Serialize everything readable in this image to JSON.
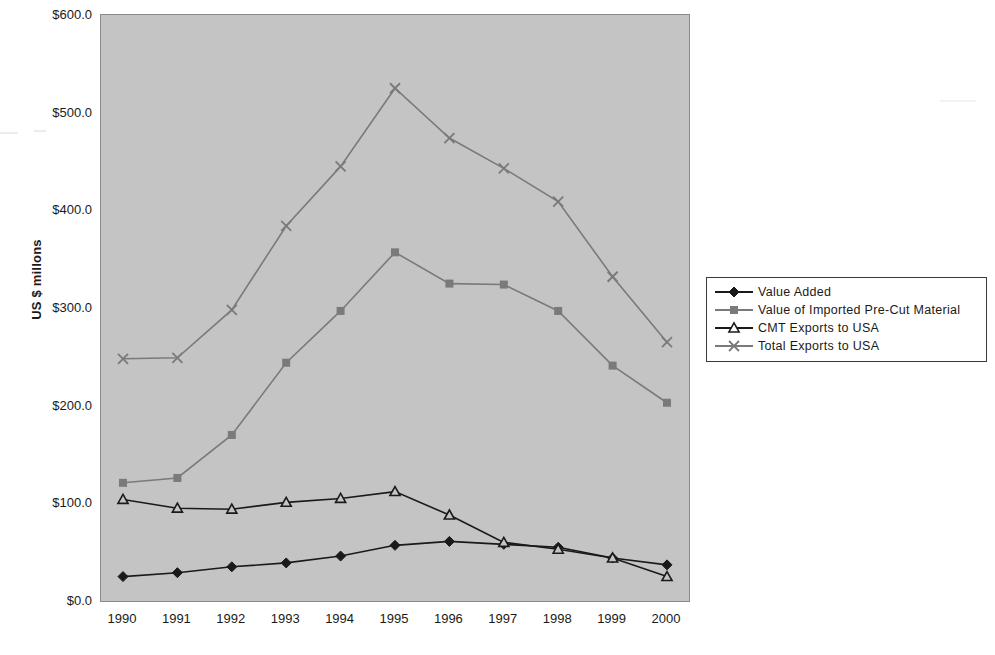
{
  "chart_data": {
    "type": "line",
    "title": "",
    "xlabel": "",
    "ylabel": "US $ millons",
    "categories": [
      "1990",
      "1991",
      "1992",
      "1993",
      "1994",
      "1995",
      "1996",
      "1997",
      "1998",
      "1999",
      "2000"
    ],
    "ylim": [
      0,
      600
    ],
    "y_ticks": [
      "$0.0",
      "$100.0",
      "$200.0",
      "$300.0",
      "$400.0",
      "$500.0",
      "$600.0"
    ],
    "y_tick_values": [
      0,
      100,
      200,
      300,
      400,
      500,
      600
    ],
    "grid": false,
    "legend_position": "right",
    "series": [
      {
        "name": "Value Added",
        "marker": "diamond",
        "color": "#1a1a1a",
        "values": [
          25,
          29,
          35,
          39,
          46,
          57,
          61,
          58,
          55,
          44,
          37
        ]
      },
      {
        "name": "Value of Imported Pre-Cut Material",
        "marker": "square",
        "color": "#7a7a7a",
        "values": [
          121,
          126,
          170,
          244,
          297,
          357,
          325,
          324,
          297,
          241,
          203
        ]
      },
      {
        "name": "CMT Exports to USA",
        "marker": "triangle",
        "color": "#1a1a1a",
        "values": [
          104,
          95,
          94,
          101,
          105,
          112,
          88,
          60,
          53,
          44,
          25
        ]
      },
      {
        "name": "Total Exports to USA",
        "marker": "cross",
        "color": "#7a7a7a",
        "values": [
          248,
          249,
          298,
          384,
          445,
          525,
          474,
          443,
          409,
          332,
          265
        ]
      }
    ]
  },
  "legend": {
    "items": [
      {
        "label": "Value Added"
      },
      {
        "label": "Value of Imported Pre-Cut Material"
      },
      {
        "label": "CMT Exports to USA"
      },
      {
        "label": "Total Exports to USA"
      }
    ]
  }
}
